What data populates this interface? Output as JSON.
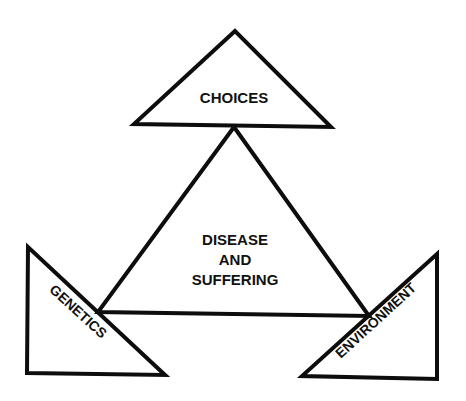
{
  "diagram": {
    "type": "concept-triangle",
    "center": {
      "label_lines": [
        "DISEASE",
        "AND",
        "SUFFERING"
      ]
    },
    "nodes": [
      {
        "id": "choices",
        "label": "CHOICES",
        "position": "top"
      },
      {
        "id": "genetics",
        "label": "GENETICS",
        "position": "bottom-left"
      },
      {
        "id": "environment",
        "label": "ENVIRONMENT",
        "position": "bottom-right"
      }
    ],
    "colors": {
      "stroke": "#0d0d0d",
      "fill": "#ffffff",
      "text": "#111111"
    }
  }
}
